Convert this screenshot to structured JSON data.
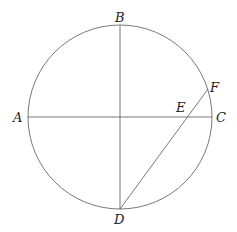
{
  "diagram": {
    "circle": {
      "cx": 120,
      "cy": 117,
      "r": 92
    },
    "points": {
      "A": {
        "label": "A",
        "x": 28,
        "y": 117
      },
      "B": {
        "label": "B",
        "x": 120,
        "y": 25
      },
      "C": {
        "label": "C",
        "x": 212,
        "y": 117
      },
      "D": {
        "label": "D",
        "x": 120,
        "y": 209
      },
      "E": {
        "label": "E",
        "x": 186,
        "y": 117
      },
      "F": {
        "label": "F",
        "x": 208,
        "y": 89
      }
    },
    "segments": [
      [
        "A",
        "C"
      ],
      [
        "B",
        "D"
      ],
      [
        "D",
        "F"
      ]
    ],
    "colors": {
      "stroke": "#555555",
      "text": "#222222"
    }
  }
}
